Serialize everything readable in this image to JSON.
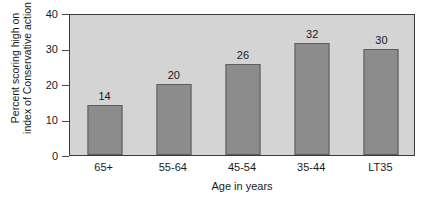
{
  "chart_data": {
    "type": "bar",
    "title": "",
    "xlabel": "Age in years",
    "ylabel": "Percent scoring high on index of Conservative action",
    "ylabel_lines": [
      "Percent scoring high on",
      "index of Conservative action"
    ],
    "categories": [
      "65+",
      "55-64",
      "45-54",
      "35-44",
      "LT35"
    ],
    "values": [
      14,
      20,
      26,
      32,
      30
    ],
    "bar_heights_drawn": [
      14,
      20,
      25.5,
      31.5,
      30
    ],
    "data_labels": [
      "14",
      "20",
      "26",
      "32",
      "30"
    ],
    "ylim": [
      0,
      40
    ],
    "ytick_values": [
      0,
      10,
      20,
      30,
      40
    ],
    "ytick_labels": [
      "0",
      "10",
      "20",
      "30",
      "40"
    ],
    "grid": false,
    "legend": null,
    "legend_position": "none",
    "colors": {
      "bar_fill": "#8c8c8c",
      "bar_stroke": "#5d5d5d",
      "plot_background": "#d4d4d4",
      "frame": "#3c3c3c",
      "page_background": "#ffffff",
      "text": "#1a1a1a"
    }
  }
}
